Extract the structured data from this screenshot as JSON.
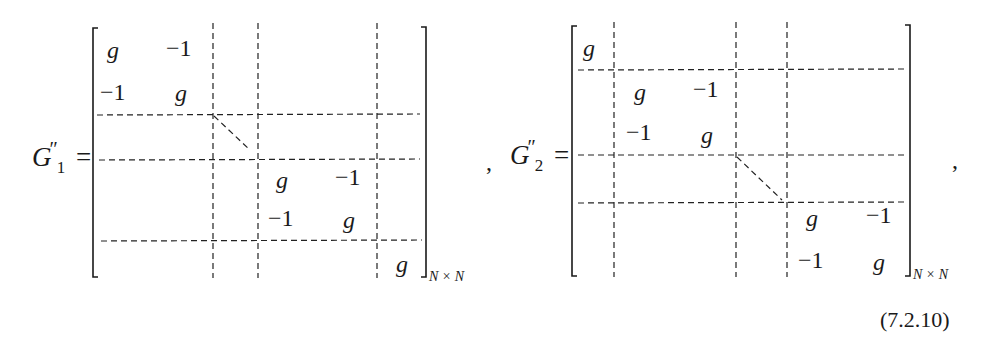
{
  "equation": {
    "number": "(7.2.10)",
    "separator": ",",
    "matrices": [
      {
        "name_base": "G",
        "name_prime": "″",
        "name_sub": "1",
        "equals": "=",
        "dimension": "N × N",
        "entries": [
          {
            "text": "g",
            "italic": true
          },
          {
            "text": "−1",
            "italic": false
          },
          {
            "text": "−1",
            "italic": false
          },
          {
            "text": "g",
            "italic": true
          },
          {
            "text": "g",
            "italic": true
          },
          {
            "text": "−1",
            "italic": false
          },
          {
            "text": "−1",
            "italic": false
          },
          {
            "text": "g",
            "italic": true
          },
          {
            "text": "g",
            "italic": true
          }
        ],
        "structure": "first 2×2 block [g −1; −1 g], dotted diagonal of blocks, 2×2 block [g −1; −1 g], final 1×1 block g"
      },
      {
        "name_base": "G",
        "name_prime": "″",
        "name_sub": "2",
        "equals": "=",
        "dimension": "N × N",
        "entries": [
          {
            "text": "g",
            "italic": true
          },
          {
            "text": "g",
            "italic": true
          },
          {
            "text": "−1",
            "italic": false
          },
          {
            "text": "−1",
            "italic": false
          },
          {
            "text": "g",
            "italic": true
          },
          {
            "text": "g",
            "italic": true
          },
          {
            "text": "−1",
            "italic": false
          },
          {
            "text": "−1",
            "italic": false
          },
          {
            "text": "g",
            "italic": true
          }
        ],
        "structure": "first 1×1 block g, 2×2 block [g −1; −1 g], dotted diagonal of blocks, final 2×2 block [g −1; −1 g]"
      }
    ]
  }
}
